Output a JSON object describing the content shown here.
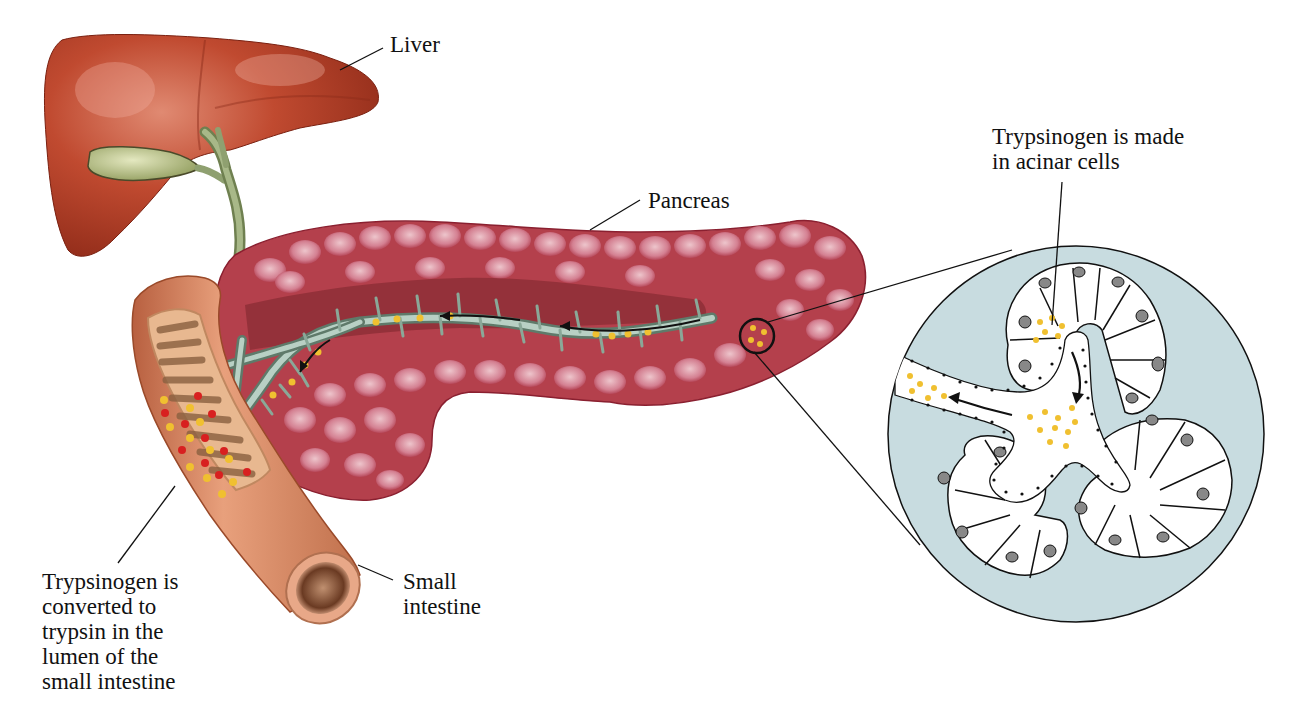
{
  "figure": {
    "type": "anatomical-illustration"
  },
  "labels": {
    "liver": "Liver",
    "pancreas": "Pancreas",
    "small_intestine": "Small\nintestine",
    "acinar": "Trypsinogen is made\nin acinar cells",
    "conversion": "Trypsinogen is\nconverted to\ntrypsin in the\nlumen of the\nsmall intestine"
  },
  "colors": {
    "liver": "#b23a22",
    "liver_highlight": "#d8705a",
    "gallbladder": "#a8b07a",
    "bile_duct": "#8fa070",
    "pancreas": "#b8404e",
    "pancreas_lobule": "#e8b4bc",
    "intestine": "#d88a64",
    "intestine_dark": "#a85a3a",
    "duct": "#a8c0b0",
    "trypsinogen_dot": "#f0c030",
    "trypsin_dot": "#d82020",
    "magnified_bg": "#c8dce0",
    "cell_fill": "#ffffff",
    "outline": "#111111"
  },
  "legend_semantics": {
    "yellow_dots": "trypsinogen",
    "red_dots": "trypsin"
  }
}
